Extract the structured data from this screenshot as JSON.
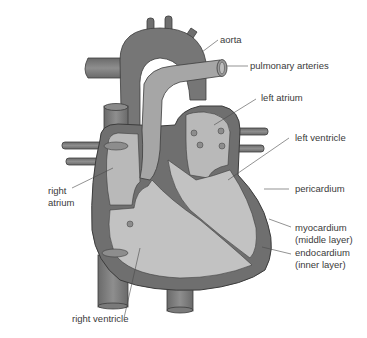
{
  "figure": {
    "colors": {
      "background": "#ffffff",
      "wall_dark": "#6e6e6e",
      "vessel": "#7d7d7d",
      "chamber_fill": "#b8b8b8",
      "chamber_light": "#c9c9c9",
      "outline": "#3c3c3c",
      "label_text": "#3a3a3a"
    },
    "labels": {
      "aorta": "aorta",
      "pulmonary_arteries": "pulmonary arteries",
      "left_atrium": "left atrium",
      "left_ventricle": "left ventricle",
      "pericardium": "pericardium",
      "myocardium_line1": "myocardium",
      "myocardium_line2": "(middle layer)",
      "endocardium_line1": "endocardium",
      "endocardium_line2": "(inner layer)",
      "right_atrium_line1": "right",
      "right_atrium_line2": "atrium",
      "right_ventricle": "right ventricle"
    }
  }
}
